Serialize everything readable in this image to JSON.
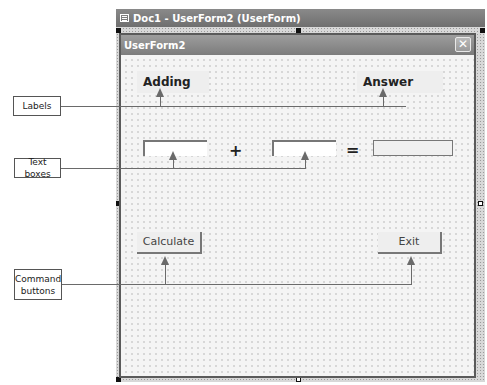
{
  "outer_window": {
    "title": "Doc1 - UserForm2 (UserForm)",
    "icon": "form-designer-icon"
  },
  "userform": {
    "title": "UserForm2",
    "close_icon": "close-icon",
    "close_glyph": "✕",
    "labels": {
      "adding": "Adding",
      "answer": "Answer"
    },
    "operators": {
      "plus": "+",
      "equals": "="
    },
    "textboxes": {
      "first_value": "",
      "second_value": "",
      "answer_value": ""
    },
    "buttons": {
      "calculate": "Calculate",
      "exit": "Exit"
    }
  },
  "callouts": {
    "labels": "Labels",
    "text_boxes": "Text boxes",
    "command_buttons_line1": "Command",
    "command_buttons_line2": "buttons"
  },
  "colors": {
    "titlebar": "#7c7c7c",
    "form_background": "#f4f4f4",
    "callout_line": "#6a6a6a"
  }
}
